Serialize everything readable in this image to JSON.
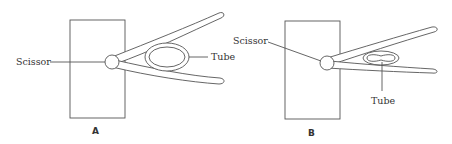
{
  "figure": {
    "panels": [
      {
        "id": "A",
        "label": "A",
        "scissor_label": "Scissor",
        "tube_label": "Tube",
        "state": "tube unclamped (round cross-section)"
      },
      {
        "id": "B",
        "label": "B",
        "scissor_label": "Scissor",
        "tube_label": "Tube",
        "state": "tube clamped (pinched cross-section)"
      }
    ],
    "colors": {
      "line": "#555555",
      "text": "#333333",
      "background": "#ffffff"
    }
  }
}
